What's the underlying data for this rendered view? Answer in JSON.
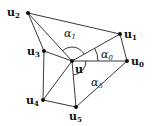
{
  "diagram": {
    "center": {
      "id": "u",
      "label": "u",
      "x": 72,
      "y": 61
    },
    "vertices": [
      {
        "id": "u0",
        "label": "u",
        "sub": "0",
        "x": 127,
        "y": 61,
        "lx": 131,
        "ly": 65
      },
      {
        "id": "u1",
        "label": "u",
        "sub": "1",
        "x": 120,
        "y": 34,
        "lx": 124,
        "ly": 36
      },
      {
        "id": "u2",
        "label": "u",
        "sub": "2",
        "x": 28,
        "y": 13,
        "lx": 6,
        "ly": 16
      },
      {
        "id": "u3",
        "label": "u",
        "sub": "3",
        "x": 44,
        "y": 51,
        "lx": 27,
        "ly": 55
      },
      {
        "id": "u4",
        "label": "u",
        "sub": "4",
        "x": 43,
        "y": 100,
        "lx": 26,
        "ly": 104
      },
      {
        "id": "u5",
        "label": "u",
        "sub": "5",
        "x": 76,
        "y": 107,
        "lx": 69,
        "ly": 121
      }
    ],
    "angles": [
      {
        "id": "alpha0",
        "label": "α",
        "sub": "0",
        "x": 101,
        "y": 57
      },
      {
        "id": "alpha1",
        "label": "α",
        "sub": "1",
        "x": 64,
        "y": 37
      },
      {
        "id": "alpha5",
        "label": "α",
        "sub": "5",
        "x": 91,
        "y": 85
      }
    ]
  }
}
